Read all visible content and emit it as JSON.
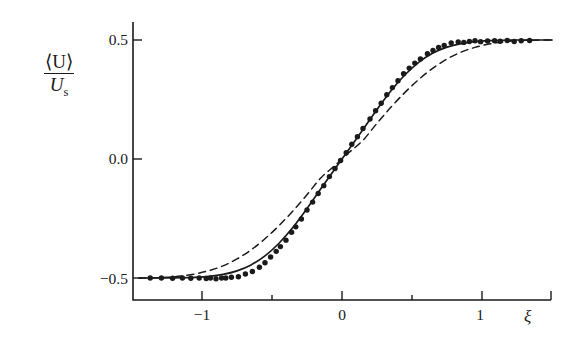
{
  "figure": {
    "background_color": "#ffffff",
    "ink_color": "#1a1a1a"
  },
  "axis": {
    "y_label_numerator": "⟨U⟩",
    "y_label_denominator": "U",
    "y_label_denominator_sub": "s",
    "x_label": "ξ"
  },
  "chart_data": {
    "type": "line",
    "title": "",
    "xlabel": "ξ",
    "ylabel": "⟨U⟩/U_s",
    "xlim": [
      -1.55,
      1.5
    ],
    "ylim": [
      -0.61,
      0.61
    ],
    "grid": false,
    "legend": "none",
    "x_ticks_major": [
      -1,
      0,
      1
    ],
    "x_tick_labels": [
      "-1",
      "0",
      "1"
    ],
    "x_ticks_minor": [
      -1.5,
      -0.5,
      0.5,
      1.5
    ],
    "y_ticks_major": [
      0.5,
      0.0,
      -0.5
    ],
    "y_tick_labels": [
      "0.5",
      "0.0",
      "-0.5"
    ],
    "series": [
      {
        "name": "model-solid",
        "style": "solid",
        "color": "#1a1a1a",
        "x": [
          -1.55,
          -1.45,
          -1.35,
          -1.25,
          -1.15,
          -1.05,
          -0.95,
          -0.85,
          -0.75,
          -0.65,
          -0.55,
          -0.45,
          -0.35,
          -0.25,
          -0.15,
          -0.05,
          0.05,
          0.15,
          0.25,
          0.35,
          0.45,
          0.55,
          0.65,
          0.75,
          0.85,
          0.95,
          1.05,
          1.15,
          1.25,
          1.35,
          1.45,
          1.5
        ],
        "y": [
          -0.5,
          -0.5,
          -0.5,
          -0.5,
          -0.499,
          -0.497,
          -0.493,
          -0.485,
          -0.47,
          -0.445,
          -0.407,
          -0.354,
          -0.287,
          -0.208,
          -0.124,
          -0.041,
          0.041,
          0.124,
          0.208,
          0.287,
          0.354,
          0.407,
          0.445,
          0.47,
          0.485,
          0.493,
          0.497,
          0.499,
          0.5,
          0.5,
          0.5,
          0.5
        ]
      },
      {
        "name": "model-dashed",
        "style": "dashed",
        "color": "#1a1a1a",
        "x": [
          -1.55,
          -1.45,
          -1.35,
          -1.25,
          -1.15,
          -1.05,
          -0.95,
          -0.85,
          -0.75,
          -0.65,
          -0.55,
          -0.45,
          -0.35,
          -0.25,
          -0.15,
          -0.05,
          0.05,
          0.15,
          0.25,
          0.35,
          0.45,
          0.55,
          0.65,
          0.75,
          0.85,
          0.95,
          1.05,
          1.15,
          1.25,
          1.35,
          1.45,
          1.5
        ],
        "y": [
          -0.5,
          -0.5,
          -0.499,
          -0.497,
          -0.492,
          -0.483,
          -0.469,
          -0.449,
          -0.42,
          -0.382,
          -0.335,
          -0.28,
          -0.218,
          -0.15,
          -0.079,
          -0.027,
          0.027,
          0.079,
          0.15,
          0.218,
          0.28,
          0.335,
          0.382,
          0.42,
          0.449,
          0.469,
          0.483,
          0.492,
          0.497,
          0.499,
          0.5,
          0.5
        ]
      }
    ],
    "scatter": {
      "name": "experimental-data",
      "marker": "filled-circle",
      "color": "#1a1a1a",
      "size": 5.4,
      "points": [
        [
          -1.37,
          -0.5
        ],
        [
          -1.29,
          -0.5
        ],
        [
          -1.21,
          -0.501
        ],
        [
          -1.14,
          -0.5
        ],
        [
          -1.08,
          -0.501
        ],
        [
          -1.02,
          -0.5
        ],
        [
          -0.97,
          -0.502
        ],
        [
          -0.94,
          -0.5
        ],
        [
          -0.9,
          -0.503
        ],
        [
          -0.86,
          -0.5
        ],
        [
          -0.83,
          -0.5
        ],
        [
          -0.79,
          -0.497
        ],
        [
          -0.74,
          -0.495
        ],
        [
          -0.69,
          -0.483
        ],
        [
          -0.64,
          -0.473
        ],
        [
          -0.59,
          -0.455
        ],
        [
          -0.55,
          -0.436
        ],
        [
          -0.51,
          -0.412
        ],
        [
          -0.47,
          -0.388
        ],
        [
          -0.44,
          -0.368
        ],
        [
          -0.4,
          -0.341
        ],
        [
          -0.36,
          -0.308
        ],
        [
          -0.33,
          -0.285
        ],
        [
          -0.29,
          -0.252
        ],
        [
          -0.25,
          -0.214
        ],
        [
          -0.21,
          -0.181
        ],
        [
          -0.17,
          -0.145
        ],
        [
          -0.13,
          -0.112
        ],
        [
          -0.09,
          -0.074
        ],
        [
          -0.05,
          -0.04
        ],
        [
          -0.01,
          -0.006
        ],
        [
          0.03,
          0.026
        ],
        [
          0.07,
          0.062
        ],
        [
          0.11,
          0.094
        ],
        [
          0.15,
          0.128
        ],
        [
          0.2,
          0.168
        ],
        [
          0.24,
          0.203
        ],
        [
          0.28,
          0.234
        ],
        [
          0.32,
          0.27
        ],
        [
          0.36,
          0.3
        ],
        [
          0.4,
          0.329
        ],
        [
          0.44,
          0.358
        ],
        [
          0.48,
          0.382
        ],
        [
          0.52,
          0.403
        ],
        [
          0.56,
          0.42
        ],
        [
          0.61,
          0.442
        ],
        [
          0.65,
          0.456
        ],
        [
          0.69,
          0.469
        ],
        [
          0.73,
          0.477
        ],
        [
          0.78,
          0.488
        ],
        [
          0.83,
          0.492
        ],
        [
          0.87,
          0.49
        ],
        [
          0.91,
          0.494
        ],
        [
          0.95,
          0.497
        ],
        [
          0.99,
          0.493
        ],
        [
          1.04,
          0.496
        ],
        [
          1.09,
          0.497
        ],
        [
          1.13,
          0.495
        ],
        [
          1.18,
          0.498
        ],
        [
          1.23,
          0.494
        ],
        [
          1.28,
          0.497
        ],
        [
          1.34,
          0.498
        ]
      ]
    }
  }
}
